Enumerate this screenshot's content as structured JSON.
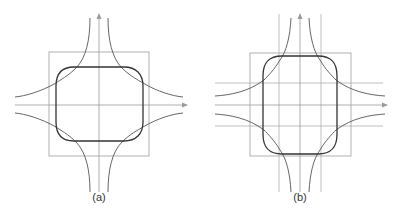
{
  "figure": {
    "panels": [
      {
        "id": "a",
        "caption": "(a)",
        "description": "Square with rounded-rectangle (superellipse-like) closed curve and four hyperbola branches, coordinate axes only",
        "has_grid_lines": false
      },
      {
        "id": "b",
        "caption": "(b)",
        "description": "Same construction with taller rounded rectangle plus two vertical and two horizontal guide lines",
        "has_grid_lines": true
      }
    ],
    "colors": {
      "axis": "#9a9a9a",
      "square": "#a8a8a8",
      "closed_curve": "#333333",
      "hyperbola": "#555555",
      "guide_lines": "#b0b0b0"
    }
  }
}
